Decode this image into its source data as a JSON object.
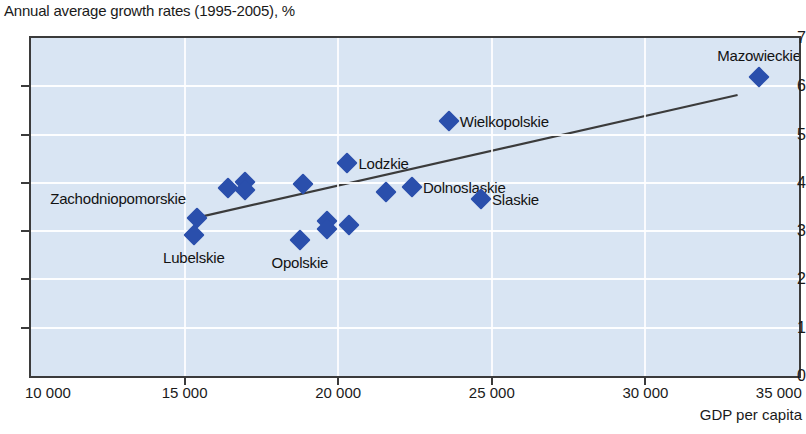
{
  "chart_data": {
    "type": "scatter",
    "title": "Annual average growth rates (1995-2005), %",
    "xlabel": "GDP per capita",
    "ylabel": "",
    "xlim": [
      10000,
      35000
    ],
    "ylim": [
      0,
      7
    ],
    "grid": true,
    "legend": "none",
    "x_ticks": [
      10000,
      15000,
      20000,
      25000,
      30000,
      35000
    ],
    "x_tick_labels": [
      "10 000",
      "15 000",
      "20 000",
      "25 000",
      "30 000",
      "35 000"
    ],
    "y_ticks": [
      0,
      1,
      2,
      3,
      4,
      5,
      6,
      7
    ],
    "y_tick_labels": [
      "0",
      "1",
      "2",
      "3",
      "4",
      "5",
      "6",
      "7"
    ],
    "marker_color": "#2a4fac",
    "plot_background": "#d9e5f3",
    "gridline_color": "#ffffff",
    "trendline": {
      "color": "#3b3b3b",
      "x_start": 15400,
      "y_start": 3.28,
      "x_end": 33000,
      "y_end": 5.82
    },
    "points": [
      {
        "label": "Zachodniopomorskie",
        "x": 15400,
        "y": 3.28,
        "label_pos": "left"
      },
      {
        "label": "Lubelskie",
        "x": 15300,
        "y": 2.92,
        "label_pos": "below"
      },
      {
        "label": "",
        "x": 16400,
        "y": 3.9,
        "label_pos": "none"
      },
      {
        "label": "",
        "x": 16950,
        "y": 4.02,
        "label_pos": "none"
      },
      {
        "label": "",
        "x": 16950,
        "y": 3.85,
        "label_pos": "none"
      },
      {
        "label": "Opolskie",
        "x": 18750,
        "y": 2.82,
        "label_pos": "below"
      },
      {
        "label": "",
        "x": 18850,
        "y": 3.97,
        "label_pos": "none"
      },
      {
        "label": "",
        "x": 19650,
        "y": 3.22,
        "label_pos": "none"
      },
      {
        "label": "",
        "x": 19650,
        "y": 3.05,
        "label_pos": "none"
      },
      {
        "label": "",
        "x": 20350,
        "y": 3.12,
        "label_pos": "none"
      },
      {
        "label": "Lodzkie",
        "x": 20300,
        "y": 4.42,
        "label_pos": "right"
      },
      {
        "label": "",
        "x": 21550,
        "y": 3.82,
        "label_pos": "none"
      },
      {
        "label": "Dolnoslaskie",
        "x": 22400,
        "y": 3.92,
        "label_pos": "right"
      },
      {
        "label": "Wielkopolskie",
        "x": 23600,
        "y": 5.28,
        "label_pos": "right"
      },
      {
        "label": "Slaskie",
        "x": 24650,
        "y": 3.66,
        "label_pos": "right"
      },
      {
        "label": "Mazowieckie",
        "x": 33700,
        "y": 6.2,
        "label_pos": "above"
      }
    ]
  }
}
